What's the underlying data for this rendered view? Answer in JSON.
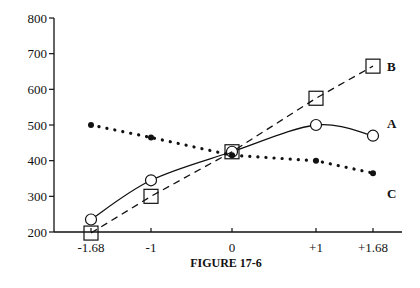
{
  "chart_data": {
    "type": "line",
    "title": "FIGURE 17-6",
    "xlabel": "",
    "ylabel": "",
    "categories": [
      "-1.68",
      "-1",
      "0",
      "+1",
      "+1.68"
    ],
    "x": [
      -1.68,
      -1,
      0,
      1,
      1.68
    ],
    "ylim": [
      200,
      800
    ],
    "yticks": [
      200,
      300,
      400,
      500,
      600,
      700,
      800
    ],
    "grid": false,
    "legend_position": "inline-right",
    "series": [
      {
        "name": "A",
        "style": "solid",
        "marker": "open-circle",
        "values": [
          235,
          345,
          425,
          500,
          470
        ]
      },
      {
        "name": "B",
        "style": "dashed",
        "marker": "open-square",
        "values": [
          197,
          300,
          425,
          575,
          665
        ]
      },
      {
        "name": "C",
        "style": "dotted",
        "marker": "filled-dot",
        "values": [
          500,
          465,
          415,
          400,
          365
        ]
      }
    ]
  },
  "caption": "FIGURE 17-6"
}
